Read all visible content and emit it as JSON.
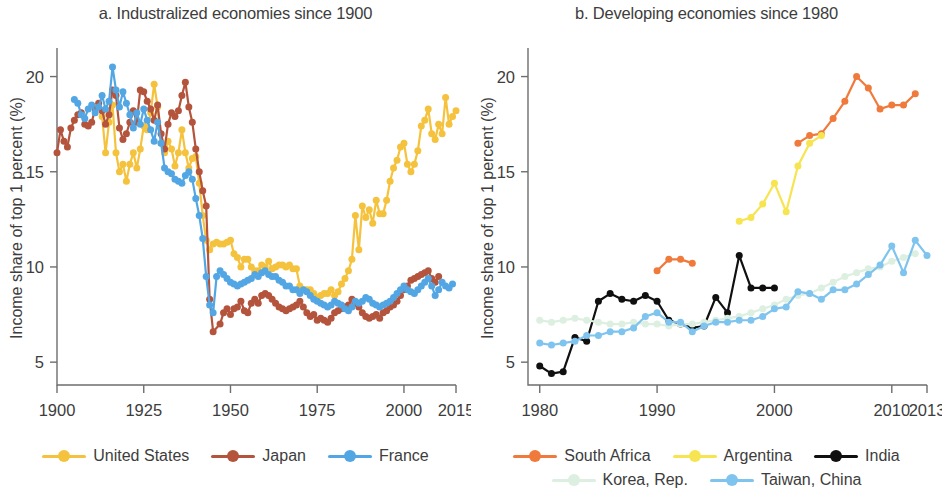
{
  "figure": {
    "panels": [
      {
        "id": "panel-a",
        "title": "a. Industralized economies since 1900",
        "ylabel": "Income share of top 1 percent (%)",
        "yticks": [
          "5",
          "10",
          "15",
          "20"
        ],
        "xticks": [
          "1900",
          "1925",
          "1950",
          "1975",
          "2000",
          "2015"
        ],
        "legend": [
          {
            "label": "United States",
            "color": "#F5C23E"
          },
          {
            "label": "Japan",
            "color": "#B4543C"
          },
          {
            "label": "France",
            "color": "#52A6E4"
          }
        ]
      },
      {
        "id": "panel-b",
        "title": "b. Developing economies since 1980",
        "ylabel": "Income share of top 1 percent (%)",
        "yticks": [
          "5",
          "10",
          "15",
          "20"
        ],
        "xticks": [
          "1980",
          "1990",
          "2000",
          "2010",
          "2013"
        ],
        "legend_row1": [
          {
            "label": "South Africa",
            "color": "#F07A3C"
          },
          {
            "label": "Argentina",
            "color": "#F6E451"
          },
          {
            "label": "India",
            "color": "#101010"
          }
        ],
        "legend_row2": [
          {
            "label": "Korea, Rep.",
            "color": "#DCEFE0"
          },
          {
            "label": "Taiwan, China",
            "color": "#7FC4EE"
          }
        ]
      }
    ]
  },
  "chart_data": [
    {
      "type": "line",
      "title": "a. Industralized economies since 1900",
      "xlabel": "",
      "ylabel": "Income share of top 1 percent (%)",
      "xlim": [
        1900,
        2015
      ],
      "ylim": [
        3.8,
        21.5
      ],
      "xticks": [
        1900,
        1925,
        1950,
        1975,
        2000,
        2015
      ],
      "yticks": [
        5,
        10,
        15,
        20
      ],
      "grid": false,
      "legend_position": "bottom",
      "series": [
        {
          "name": "United States",
          "color": "#F5C23E",
          "x": [
            1913,
            1914,
            1915,
            1916,
            1917,
            1918,
            1919,
            1920,
            1921,
            1922,
            1923,
            1924,
            1925,
            1926,
            1927,
            1928,
            1929,
            1930,
            1931,
            1932,
            1933,
            1934,
            1935,
            1936,
            1937,
            1938,
            1939,
            1940,
            1941,
            1942,
            1943,
            1944,
            1945,
            1946,
            1947,
            1948,
            1949,
            1950,
            1951,
            1952,
            1953,
            1954,
            1955,
            1956,
            1957,
            1958,
            1959,
            1960,
            1961,
            1962,
            1963,
            1964,
            1965,
            1966,
            1967,
            1968,
            1969,
            1970,
            1971,
            1972,
            1973,
            1974,
            1975,
            1976,
            1977,
            1978,
            1979,
            1980,
            1981,
            1982,
            1983,
            1984,
            1985,
            1986,
            1987,
            1988,
            1989,
            1990,
            1991,
            1992,
            1993,
            1994,
            1995,
            1996,
            1997,
            1998,
            1999,
            2000,
            2001,
            2002,
            2003,
            2004,
            2005,
            2006,
            2007,
            2008,
            2009,
            2010,
            2011,
            2012,
            2013,
            2014,
            2015
          ],
          "y": [
            17.9,
            16.0,
            17.6,
            18.5,
            16.0,
            15.0,
            15.4,
            14.5,
            15.4,
            16.0,
            15.2,
            16.2,
            17.4,
            17.2,
            18.1,
            19.6,
            18.4,
            16.5,
            16.0,
            16.6,
            16.2,
            15.3,
            16.0,
            17.2,
            16.0,
            15.2,
            15.7,
            15.8,
            14.4,
            12.7,
            11.4,
            10.9,
            11.2,
            11.3,
            11.2,
            11.2,
            11.3,
            11.4,
            10.7,
            10.5,
            10.0,
            10.4,
            10.4,
            10.0,
            9.8,
            9.8,
            10.1,
            10.0,
            10.3,
            9.9,
            10.0,
            10.1,
            10.1,
            10.0,
            10.1,
            9.9,
            9.9,
            9.0,
            8.8,
            8.8,
            8.8,
            8.6,
            8.4,
            8.5,
            8.6,
            8.6,
            8.8,
            8.5,
            8.7,
            9.1,
            9.4,
            9.8,
            10.4,
            12.7,
            10.9,
            13.2,
            12.6,
            13.0,
            12.3,
            13.5,
            12.8,
            12.8,
            13.5,
            14.5,
            15.2,
            15.6,
            16.3,
            16.5,
            15.4,
            15.0,
            15.4,
            16.1,
            17.4,
            17.7,
            18.3,
            17.0,
            16.7,
            17.5,
            17.0,
            18.9,
            17.5,
            17.9,
            18.2
          ]
        },
        {
          "name": "Japan",
          "color": "#B4543C",
          "x": [
            1900,
            1901,
            1902,
            1903,
            1904,
            1905,
            1906,
            1907,
            1908,
            1909,
            1910,
            1911,
            1912,
            1913,
            1914,
            1915,
            1916,
            1917,
            1918,
            1919,
            1920,
            1921,
            1922,
            1923,
            1924,
            1925,
            1926,
            1927,
            1928,
            1929,
            1930,
            1931,
            1932,
            1933,
            1934,
            1935,
            1936,
            1937,
            1938,
            1939,
            1940,
            1941,
            1942,
            1943,
            1944,
            1945,
            1947,
            1948,
            1949,
            1950,
            1951,
            1952,
            1953,
            1954,
            1955,
            1956,
            1957,
            1958,
            1959,
            1960,
            1961,
            1962,
            1963,
            1964,
            1965,
            1966,
            1967,
            1968,
            1969,
            1970,
            1971,
            1972,
            1973,
            1974,
            1975,
            1976,
            1977,
            1978,
            1979,
            1980,
            1981,
            1982,
            1983,
            1984,
            1985,
            1986,
            1987,
            1988,
            1989,
            1990,
            1991,
            1992,
            1993,
            1994,
            1995,
            1996,
            1997,
            1998,
            1999,
            2000,
            2001,
            2002,
            2003,
            2004,
            2005,
            2006,
            2007,
            2008,
            2009,
            2010
          ],
          "y": [
            16.0,
            17.2,
            16.6,
            16.3,
            17.3,
            17.7,
            18.0,
            18.1,
            17.5,
            17.4,
            17.6,
            18.3,
            18.6,
            18.2,
            17.5,
            18.0,
            19.3,
            19.0,
            17.3,
            16.7,
            17.0,
            17.6,
            18.2,
            17.6,
            19.3,
            19.2,
            18.7,
            18.3,
            17.7,
            18.5,
            17.0,
            16.2,
            17.5,
            18.1,
            17.9,
            18.2,
            19.0,
            19.7,
            18.4,
            17.6,
            16.2,
            15.0,
            14.0,
            13.2,
            8.3,
            6.6,
            7.0,
            7.6,
            7.8,
            7.5,
            7.8,
            7.9,
            8.2,
            7.7,
            7.6,
            8.1,
            8.3,
            8.1,
            8.5,
            8.6,
            8.5,
            8.3,
            8.1,
            7.9,
            7.8,
            7.7,
            7.8,
            7.9,
            8.0,
            8.2,
            7.9,
            7.6,
            7.4,
            7.5,
            7.2,
            7.3,
            7.2,
            7.1,
            7.3,
            7.6,
            7.7,
            7.8,
            7.9,
            8.0,
            8.3,
            8.1,
            7.9,
            7.6,
            7.4,
            7.3,
            7.4,
            7.5,
            7.3,
            7.6,
            7.7,
            7.9,
            8.0,
            8.2,
            8.5,
            8.8,
            9.0,
            9.3,
            9.4,
            9.5,
            9.6,
            9.7,
            9.8,
            9.4,
            9.2,
            9.5
          ]
        },
        {
          "name": "France",
          "color": "#52A6E4",
          "x": [
            1905,
            1906,
            1907,
            1908,
            1909,
            1910,
            1911,
            1912,
            1913,
            1914,
            1915,
            1916,
            1917,
            1918,
            1919,
            1920,
            1921,
            1922,
            1923,
            1924,
            1925,
            1926,
            1927,
            1928,
            1929,
            1930,
            1931,
            1932,
            1933,
            1934,
            1935,
            1936,
            1937,
            1938,
            1939,
            1940,
            1941,
            1942,
            1943,
            1944,
            1945,
            1946,
            1947,
            1948,
            1949,
            1950,
            1951,
            1952,
            1953,
            1954,
            1955,
            1956,
            1957,
            1958,
            1959,
            1960,
            1961,
            1962,
            1963,
            1964,
            1965,
            1966,
            1967,
            1968,
            1969,
            1970,
            1971,
            1972,
            1973,
            1974,
            1975,
            1976,
            1977,
            1978,
            1979,
            1980,
            1981,
            1982,
            1983,
            1984,
            1985,
            1986,
            1987,
            1988,
            1989,
            1990,
            1991,
            1992,
            1993,
            1994,
            1995,
            1996,
            1997,
            1998,
            1999,
            2000,
            2001,
            2002,
            2003,
            2004,
            2005,
            2006,
            2007,
            2008,
            2009,
            2010,
            2011,
            2012,
            2013,
            2014
          ],
          "y": [
            18.8,
            18.6,
            18.0,
            17.8,
            18.3,
            18.5,
            18.1,
            18.4,
            19.0,
            18.3,
            18.7,
            20.5,
            19.3,
            18.4,
            19.2,
            18.6,
            18.0,
            17.3,
            18.1,
            17.5,
            18.3,
            17.7,
            17.2,
            16.6,
            17.6,
            16.5,
            15.2,
            15.0,
            14.9,
            14.6,
            14.5,
            14.4,
            14.8,
            15.0,
            14.6,
            13.6,
            12.7,
            11.5,
            9.5,
            8.0,
            7.6,
            9.5,
            9.8,
            9.6,
            9.4,
            9.2,
            9.1,
            9.0,
            9.1,
            9.2,
            9.3,
            9.4,
            9.6,
            9.5,
            9.7,
            9.8,
            9.6,
            9.5,
            9.5,
            9.3,
            9.2,
            9.0,
            9.0,
            8.8,
            8.8,
            8.6,
            8.8,
            8.7,
            8.5,
            8.3,
            8.2,
            8.1,
            8.0,
            7.9,
            8.0,
            8.2,
            8.1,
            8.0,
            7.8,
            7.7,
            7.9,
            8.2,
            8.1,
            8.2,
            8.4,
            8.3,
            8.1,
            8.0,
            7.9,
            8.0,
            8.1,
            8.2,
            8.4,
            8.6,
            8.8,
            9.0,
            8.8,
            8.7,
            8.6,
            8.8,
            9.0,
            9.2,
            9.4,
            9.0,
            8.5,
            8.8,
            9.2,
            9.0,
            8.9,
            9.1
          ]
        }
      ]
    },
    {
      "type": "line",
      "title": "b. Developing economies since 1980",
      "xlabel": "",
      "ylabel": "Income share of top 1 percent (%)",
      "xlim": [
        1979,
        2013
      ],
      "ylim": [
        3.8,
        21.5
      ],
      "xticks": [
        1980,
        1990,
        2000,
        2010,
        2013
      ],
      "yticks": [
        5,
        10,
        15,
        20
      ],
      "grid": false,
      "legend_position": "bottom",
      "series": [
        {
          "name": "South Africa",
          "color": "#F07A3C",
          "x": [
            1990,
            1991,
            1992,
            1993,
            2002,
            2003,
            2004,
            2005,
            2006,
            2007,
            2008,
            2009,
            2010,
            2011,
            2012
          ],
          "y": [
            9.8,
            10.4,
            10.4,
            10.2,
            16.5,
            16.9,
            17.0,
            17.8,
            18.7,
            20.0,
            19.4,
            18.3,
            18.5,
            18.5,
            19.1
          ]
        },
        {
          "name": "Argentina",
          "color": "#F6E451",
          "x": [
            1997,
            1998,
            1999,
            2000,
            2001,
            2002,
            2003,
            2004
          ],
          "y": [
            12.4,
            12.6,
            13.3,
            14.4,
            12.9,
            15.3,
            16.5,
            16.9
          ]
        },
        {
          "name": "India",
          "color": "#101010",
          "x": [
            1980,
            1981,
            1982,
            1983,
            1984,
            1985,
            1986,
            1987,
            1988,
            1989,
            1990,
            1991,
            1992,
            1993,
            1994,
            1995,
            1996,
            1997,
            1998,
            1999,
            2000
          ],
          "y": [
            4.8,
            4.4,
            4.5,
            6.3,
            6.1,
            8.2,
            8.6,
            8.3,
            8.2,
            8.5,
            8.2,
            7.2,
            7.0,
            6.8,
            6.9,
            8.4,
            7.6,
            10.6,
            8.9,
            8.9,
            8.9
          ]
        },
        {
          "name": "Korea, Rep.",
          "color": "#DCEFE0",
          "x": [
            1980,
            1981,
            1982,
            1983,
            1984,
            1985,
            1986,
            1987,
            1988,
            1989,
            1990,
            1991,
            1992,
            1993,
            1994,
            1995,
            1996,
            1997,
            1998,
            1999,
            2000,
            2001,
            2002,
            2003,
            2004,
            2005,
            2006,
            2007,
            2008,
            2009,
            2010,
            2011,
            2012
          ],
          "y": [
            7.2,
            7.1,
            7.2,
            7.3,
            7.2,
            7.1,
            7.0,
            7.0,
            7.1,
            7.0,
            7.0,
            6.9,
            7.0,
            7.0,
            7.1,
            7.2,
            7.3,
            7.4,
            7.6,
            7.8,
            8.0,
            8.3,
            8.5,
            8.6,
            8.9,
            9.2,
            9.5,
            9.7,
            9.9,
            10.0,
            10.3,
            10.5,
            10.7
          ]
        },
        {
          "name": "Taiwan, China",
          "color": "#7FC4EE",
          "x": [
            1980,
            1981,
            1982,
            1983,
            1984,
            1985,
            1986,
            1987,
            1988,
            1989,
            1990,
            1991,
            1992,
            1993,
            1994,
            1995,
            1996,
            1997,
            1998,
            1999,
            2000,
            2001,
            2002,
            2003,
            2004,
            2005,
            2006,
            2007,
            2008,
            2009,
            2010,
            2011,
            2012,
            2013
          ],
          "y": [
            6.0,
            5.9,
            6.0,
            6.1,
            6.4,
            6.4,
            6.6,
            6.6,
            6.8,
            7.4,
            7.6,
            7.1,
            7.1,
            6.6,
            6.9,
            7.1,
            7.1,
            7.2,
            7.2,
            7.4,
            7.8,
            7.9,
            8.7,
            8.6,
            8.3,
            8.8,
            8.8,
            9.1,
            9.6,
            10.1,
            11.1,
            9.7,
            11.4,
            10.6
          ]
        }
      ]
    }
  ]
}
